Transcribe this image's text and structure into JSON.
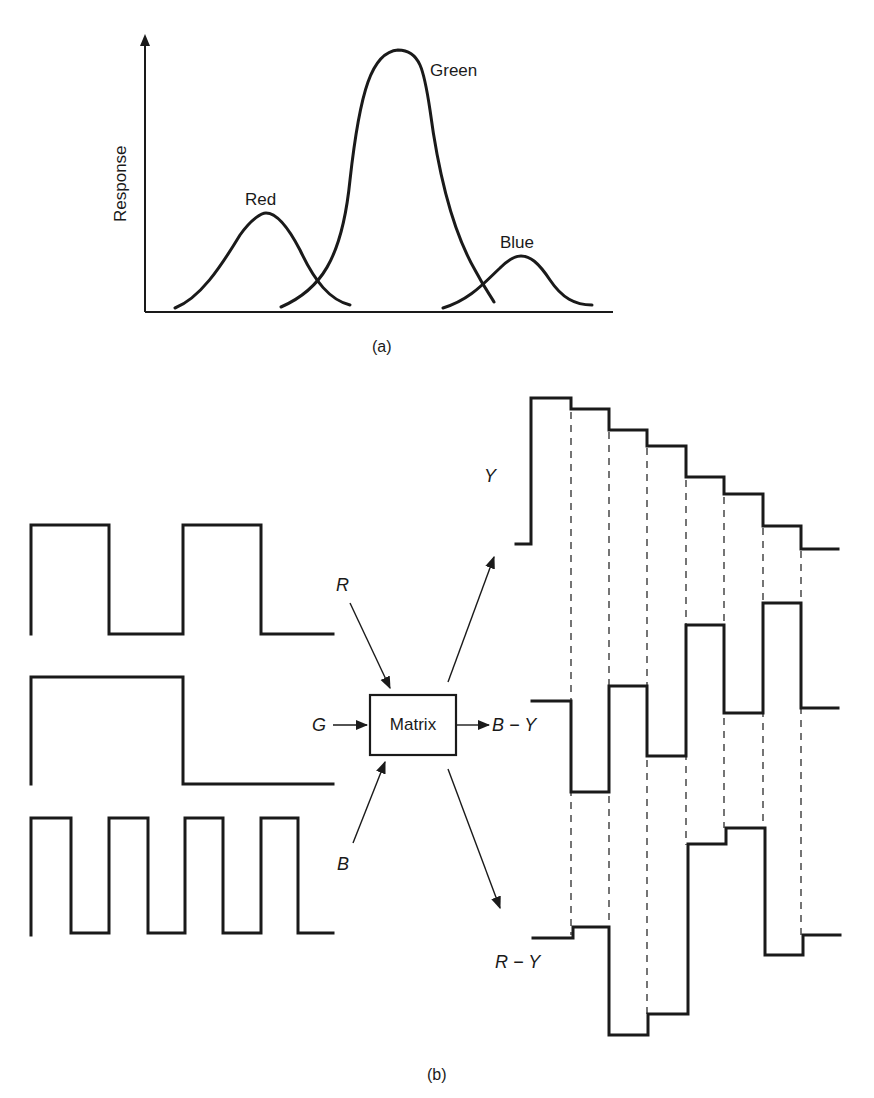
{
  "figure_a": {
    "caption": "(a)",
    "y_axis_label": "Response",
    "curves": [
      {
        "name": "Red",
        "label": "Red",
        "peak_x": 266,
        "peak_y": 213
      },
      {
        "name": "Green",
        "label": "Green",
        "peak_x": 400,
        "peak_y": 50
      },
      {
        "name": "Blue",
        "label": "Blue",
        "peak_x": 521,
        "peak_y": 256
      }
    ]
  },
  "figure_b": {
    "caption": "(b)",
    "matrix_label": "Matrix",
    "inputs": {
      "r": "R",
      "g": "G",
      "b": "B"
    },
    "outputs": {
      "y": "Y",
      "b_minus_y": "B − Y",
      "r_minus_y": "R − Y"
    },
    "input_waveforms": {
      "R": [
        1,
        1,
        0,
        0,
        1,
        1,
        0,
        0
      ],
      "G": [
        1,
        1,
        1,
        1,
        0,
        0,
        0,
        0
      ],
      "B": [
        1,
        0,
        1,
        0,
        1,
        0,
        1,
        0
      ]
    },
    "output_waveforms": {
      "Y_levels_px": [
        398,
        409,
        430,
        446,
        477,
        494,
        526,
        549
      ],
      "B_minus_Y_levels_px": [
        706,
        800,
        686,
        756,
        625,
        714,
        603,
        708
      ],
      "R_minus_Y_levels_px": [
        934,
        1029,
        1016,
        844,
        827,
        955,
        935
      ]
    }
  }
}
